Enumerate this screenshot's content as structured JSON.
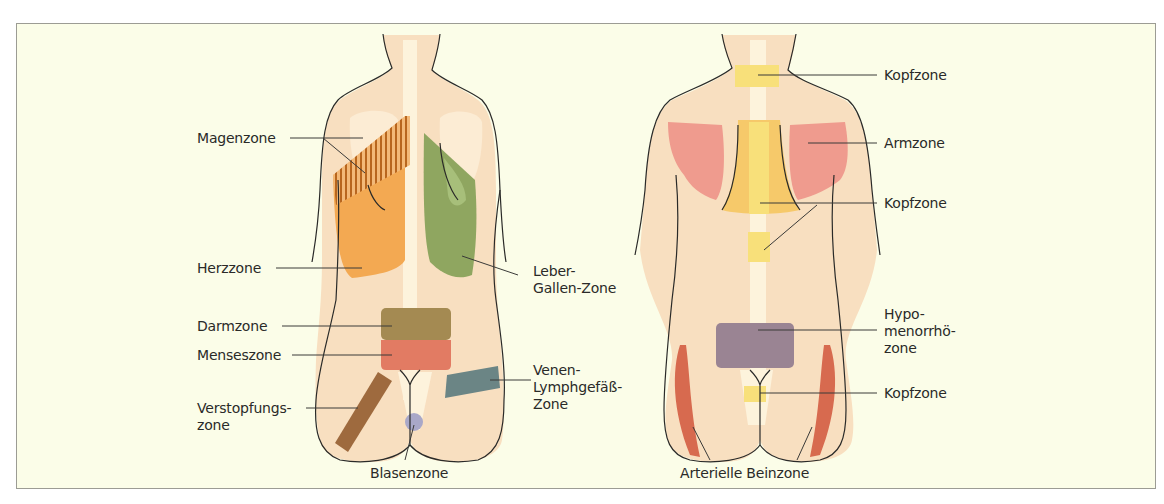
{
  "figure": {
    "left_back": {
      "title": "Left back view — zones",
      "labels": {
        "magen": "Magenzone",
        "herz": "Herzzone",
        "leber_1": "Leber-",
        "leber_2": "Gallen-Zone",
        "darm": "Darmzone",
        "menses": "Menseszone",
        "venen_1": "Venen-",
        "venen_2": "Lymphgefäß-",
        "venen_3": "Zone",
        "verstopf_1": "Verstopfungs-",
        "verstopf_2": "zone",
        "blasen": "Blasenzone"
      }
    },
    "right_back": {
      "title": "Right back view — zones",
      "labels": {
        "kopf_neck": "Kopfzone",
        "arm": "Armzone",
        "kopf_thorax": "Kopfzone",
        "hypo_1": "Hypo-",
        "hypo_2": "menorrhö-",
        "hypo_3": "zone",
        "kopf_sacral": "Kopfzone",
        "arterielle": "Arterielle Beinzone"
      }
    },
    "colors": {
      "background": "#fbfde8",
      "skin": "#f8dfc0",
      "bone": "#fdf3dc",
      "herz": "#f3a952",
      "magen_hatch": "#b8661e",
      "leber": "#8fa660",
      "darm": "#a48a52",
      "menses": "#e27b63",
      "verstopf": "#9e6a3e",
      "venen": "#6b8585",
      "blasen": "#a9a8c8",
      "kopf": "#f8e07a",
      "arm": "#ef9b8e",
      "hypo": "#9a8493",
      "arterielle": "#d76a4f",
      "outline": "#2a2a28"
    }
  }
}
